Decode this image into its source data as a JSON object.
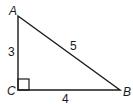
{
  "diagram": {
    "type": "right-triangle",
    "stroke_color": "#1a1a1a",
    "background": "#ffffff",
    "vertices": [
      {
        "name": "A",
        "x": 18,
        "y": 16
      },
      {
        "name": "B",
        "x": 120,
        "y": 90
      },
      {
        "name": "C",
        "x": 18,
        "y": 90
      }
    ],
    "labels": {
      "A": "A",
      "B": "B",
      "C": "C"
    },
    "sides": {
      "AC": "3",
      "CB": "4",
      "AB": "5"
    },
    "right_angle_at": "C"
  }
}
